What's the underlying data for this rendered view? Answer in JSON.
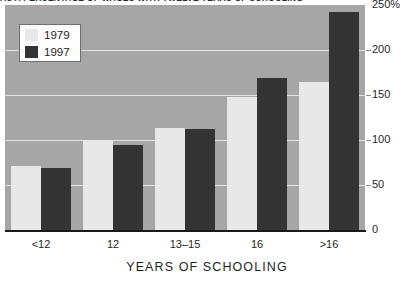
{
  "chart": {
    "title": "AS A PERCENTAGE OF WAGES WITH TWELVE YEARS OF SCHOOLING",
    "xlabel": "YEARS OF SCHOOLING",
    "ylabel": "",
    "zero_label": "0"
  },
  "legend": {
    "items": [
      {
        "label": "1979",
        "color": "#e8e8e8"
      },
      {
        "label": "1997",
        "color": "#343434"
      }
    ]
  },
  "colors": {
    "plot_background": "#a6a6a6",
    "gridline": "#e2e2e2",
    "axis": "#1a1a1a",
    "series_1979": "#e8e8e8",
    "series_1997": "#343434",
    "text": "#1f1f1f"
  },
  "chart_data": {
    "type": "bar",
    "title": "AS A PERCENTAGE OF WAGES WITH TWELVE YEARS OF SCHOOLING",
    "xlabel": "YEARS OF SCHOOLING",
    "ylabel": "",
    "categories": [
      "<12",
      "12",
      "13–15",
      "16",
      ">16"
    ],
    "series": [
      {
        "name": "1979",
        "values": [
          71,
          100,
          113,
          148,
          165
        ]
      },
      {
        "name": "1997",
        "values": [
          69,
          95,
          112,
          169,
          242
        ]
      }
    ],
    "ylim": [
      0,
      250
    ],
    "yticks": [
      0,
      50,
      100,
      150,
      200,
      250
    ],
    "ytick_labels": [
      "0",
      "50",
      "100",
      "150",
      "200",
      "250%"
    ],
    "grid": true,
    "legend_position": "top-left"
  }
}
